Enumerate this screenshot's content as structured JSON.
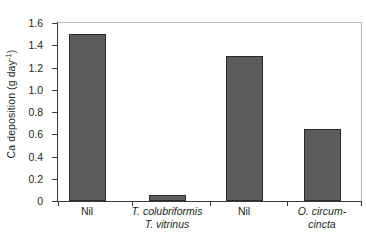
{
  "chart_data": {
    "type": "bar",
    "title": "",
    "subtitle": "",
    "xlabel": "",
    "ylabel": "Ca deposition (g day",
    "ylabel_exponent": "-1",
    "ylabel_suffix": ")",
    "ylabel_plain": "Ca deposition (g day⁻¹)",
    "categories": [
      "Nil",
      "T. colubriformis T. vitrinus",
      "Nil",
      "O. circum- cincta"
    ],
    "category_lines": [
      [
        "Nil"
      ],
      [
        "T. colubriformis",
        "T. vitrinus"
      ],
      [
        "Nil"
      ],
      [
        "O. circum-",
        "cincta"
      ]
    ],
    "category_italic": [
      false,
      true,
      false,
      true
    ],
    "values": [
      1.5,
      0.05,
      1.3,
      0.65
    ],
    "ylim": [
      0,
      1.6
    ],
    "yticks": [
      0,
      0.2,
      0.4,
      0.6,
      0.8,
      1.0,
      1.2,
      1.4,
      1.6
    ],
    "ytick_labels": [
      "0",
      "0.2",
      "0.4",
      "0.6",
      "0.8",
      "1.0",
      "1.2",
      "1.4",
      "1.6"
    ],
    "grid": false,
    "legend": null,
    "bar_color": "#5c5c5c",
    "bar_edge_color": "#2b2b2b",
    "axis_color": "#3a3a3a",
    "frame_color": "#b9b9b9",
    "bar_left_px": [
      11,
      91,
      168,
      246
    ],
    "bar_width_px": 37,
    "xtick_positions_px": [
      0,
      74,
      152,
      229,
      303
    ],
    "label_centers_px": [
      30,
      110,
      187,
      265
    ],
    "label_widths_px": [
      60,
      120,
      60,
      90
    ]
  }
}
